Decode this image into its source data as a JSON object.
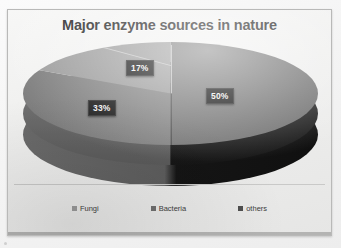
{
  "chart_data": {
    "type": "pie",
    "title": "Major enzyme sources in nature",
    "categories": [
      "Fungi",
      "Bacteria",
      "others"
    ],
    "values": [
      17,
      33,
      50
    ],
    "value_labels": [
      "17%",
      "33%",
      "50%"
    ],
    "unit": "%",
    "legend_position": "bottom",
    "three_d": true,
    "grid": false,
    "xlabel": "",
    "ylabel": "",
    "slice_colors": [
      "#9b9b9b",
      "#6f6f6f",
      "#4f4f4f"
    ]
  },
  "chart": {
    "title": "Major enzyme sources in nature",
    "labels": {
      "fungi": "17%",
      "bacteria": "33%",
      "others": "50%"
    }
  },
  "legend": {
    "items": [
      {
        "label": "Fungi"
      },
      {
        "label": "Bacteria"
      },
      {
        "label": "others"
      }
    ]
  },
  "colors": {
    "title_text": "#2a2a2a",
    "label_text": "#f2f2f2",
    "label_background": "#151515",
    "slide_background": "#efefee",
    "frame_border": "#b9b9b8",
    "pie_side_dark": "#161616",
    "pie_side_mid": "#5a5a5a"
  }
}
